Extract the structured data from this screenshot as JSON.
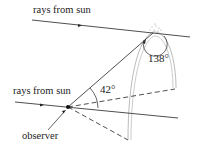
{
  "diagram": {
    "labels": {
      "top_ray": "rays from sun",
      "bottom_ray": "rays from sun",
      "observer": "observer",
      "angle_observer": "42°",
      "angle_drop": "138°"
    },
    "colors": {
      "line": "#222222",
      "bow": "#bbbbbb"
    }
  }
}
